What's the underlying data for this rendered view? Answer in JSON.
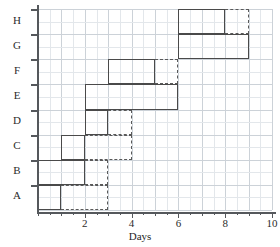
{
  "chart_data": {
    "type": "bar",
    "subtype": "gantt",
    "title": "",
    "xlabel": "Days",
    "ylabel": "",
    "xlim": [
      0,
      10
    ],
    "xticks": [
      0,
      1,
      2,
      3,
      4,
      5,
      6,
      7,
      8,
      9,
      10
    ],
    "xticklabels": [
      "",
      "",
      "2",
      "",
      "4",
      "",
      "6",
      "",
      "8",
      "",
      "10"
    ],
    "major_xticks": [
      2,
      4,
      6,
      8,
      10
    ],
    "categories": [
      "A",
      "B",
      "C",
      "D",
      "E",
      "F",
      "G",
      "H"
    ],
    "grid": true,
    "legend": "none",
    "series": [
      {
        "name": "Task duration (solid)",
        "style": "solid",
        "bars": [
          {
            "task": "A",
            "start": 0,
            "end": 1,
            "duration": 1
          },
          {
            "task": "B",
            "start": 0,
            "end": 2,
            "duration": 2
          },
          {
            "task": "C",
            "start": 1,
            "end": 2,
            "duration": 1
          },
          {
            "task": "D",
            "start": 2,
            "end": 3,
            "duration": 1
          },
          {
            "task": "E",
            "start": 2,
            "end": 6,
            "duration": 4
          },
          {
            "task": "F",
            "start": 3,
            "end": 5,
            "duration": 2
          },
          {
            "task": "G",
            "start": 6,
            "end": 9,
            "duration": 3
          },
          {
            "task": "H",
            "start": 6,
            "end": 8,
            "duration": 2
          }
        ]
      },
      {
        "name": "Float / slack (dashed)",
        "style": "dashed",
        "bars": [
          {
            "task": "A",
            "start": 1,
            "end": 3,
            "float": 2
          },
          {
            "task": "B",
            "start": 2,
            "end": 3,
            "float": 1
          },
          {
            "task": "C",
            "start": 2,
            "end": 4,
            "float": 2
          },
          {
            "task": "D",
            "start": 3,
            "end": 4,
            "float": 1
          },
          {
            "task": "E",
            "start": 6,
            "end": 6,
            "float": 0
          },
          {
            "task": "F",
            "start": 5,
            "end": 6,
            "float": 1
          },
          {
            "task": "G",
            "start": 9,
            "end": 9,
            "float": 0
          },
          {
            "task": "H",
            "start": 8,
            "end": 9,
            "float": 1
          }
        ]
      }
    ]
  },
  "axis": {
    "x_title": "Days"
  }
}
